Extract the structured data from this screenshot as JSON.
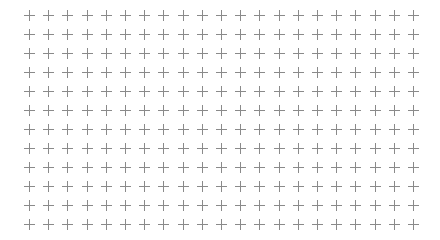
{
  "pattern": {
    "type": "plus-sign grid",
    "columns": 21,
    "rows": 12,
    "origin_x": 29,
    "origin_y": 15,
    "pitch_x": 19.2,
    "pitch_y": 19,
    "cross_size": 11,
    "cross_color": "#8a8a8a",
    "background": "#ffffff",
    "icon": "plus-icon"
  }
}
